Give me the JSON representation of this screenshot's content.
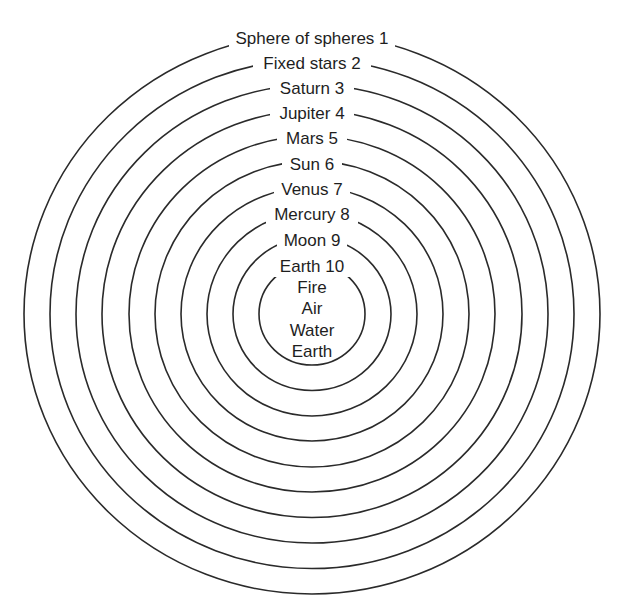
{
  "diagram": {
    "type": "concentric-spheres",
    "center": {
      "x": 312,
      "y": 314
    },
    "stroke_color": "#2a2a2a",
    "background": "#ffffff",
    "spheres": [
      {
        "label": "Sphere of spheres 1",
        "rx": 288,
        "ry": 280,
        "label_y": 38,
        "label_w": 166
      },
      {
        "label": "Fixed stars 2",
        "rx": 262,
        "ry": 254.5,
        "label_y": 63,
        "label_w": 118
      },
      {
        "label": "Saturn 3",
        "rx": 236,
        "ry": 229,
        "label_y": 88,
        "label_w": 84
      },
      {
        "label": "Jupiter 4",
        "rx": 210,
        "ry": 203.5,
        "label_y": 113,
        "label_w": 84
      },
      {
        "label": "Mars 5",
        "rx": 183,
        "ry": 178,
        "label_y": 138,
        "label_w": 70
      },
      {
        "label": "Sun 6",
        "rx": 157,
        "ry": 153,
        "label_y": 164,
        "label_w": 60
      },
      {
        "label": "Venus 7",
        "rx": 131,
        "ry": 127,
        "label_y": 189,
        "label_w": 76
      },
      {
        "label": "Mercury 8",
        "rx": 105,
        "ry": 102,
        "label_y": 214,
        "label_w": 92
      },
      {
        "label": "Moon 9",
        "rx": 79,
        "ry": 76.5,
        "label_y": 240,
        "label_w": 70
      },
      {
        "label": "Earth 10",
        "rx": 53,
        "ry": 51,
        "label_y": 266,
        "label_w": 80
      }
    ],
    "inner_elements": [
      {
        "label": "Fire",
        "y": 287
      },
      {
        "label": "Air",
        "y": 308
      },
      {
        "label": "Water",
        "y": 330
      },
      {
        "label": "Earth",
        "y": 351
      }
    ]
  }
}
